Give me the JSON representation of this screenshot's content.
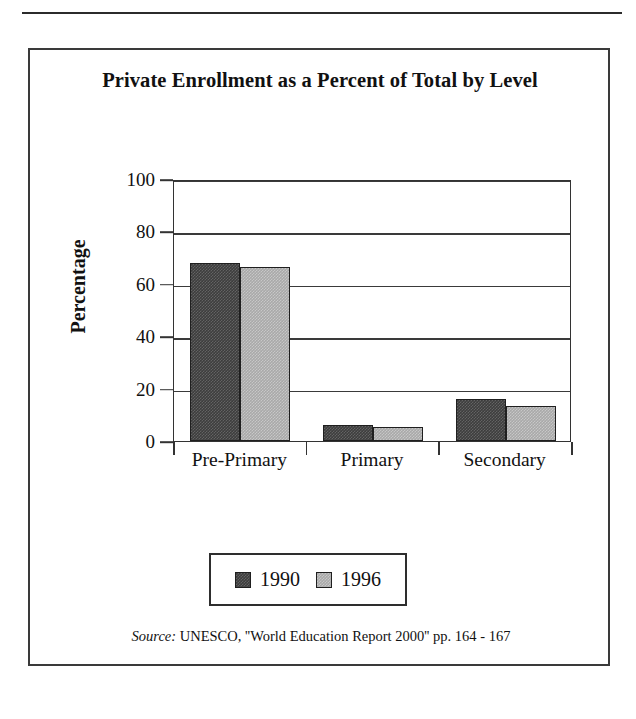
{
  "figure": {
    "title": "Private Enrollment as a Percent of Total by Level",
    "source_prefix": "Source:",
    "source_text": "UNESCO, ''World Education Report 2000'' pp. 164 - 167"
  },
  "colors": {
    "series_1990": "#3d3d3d",
    "series_1996": "#a9a9a9",
    "axis": "#333333",
    "text": "#111111",
    "frame": "#3a3a3a"
  },
  "chart_data": {
    "type": "bar",
    "title": "Private Enrollment as a Percent of Total by Level",
    "xlabel": "",
    "ylabel": "Percentage",
    "categories": [
      "Pre-Primary",
      "Primary",
      "Secondary"
    ],
    "series": [
      {
        "name": "1990",
        "values": [
          68,
          6,
          16
        ]
      },
      {
        "name": "1996",
        "values": [
          66.5,
          5.5,
          13.5
        ]
      }
    ],
    "ylim": [
      0,
      100
    ],
    "yticks": [
      0,
      20,
      40,
      60,
      80,
      100
    ],
    "ytick_labels": [
      "0",
      "20",
      "40",
      "60",
      "80",
      "100"
    ],
    "grid": true,
    "legend_position": "bottom-center",
    "annotations": [
      "Source: UNESCO, ''World Education Report 2000'' pp. 164 - 167"
    ]
  }
}
